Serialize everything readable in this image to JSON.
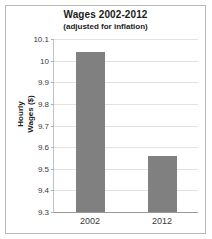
{
  "chart_data": {
    "type": "bar",
    "title": "Wages 2002-2012",
    "subtitle": "(adjusted for inflation)",
    "xlabel": "",
    "ylabel": "Hourly Wages ($)",
    "ylabel_line1": "Hourly",
    "ylabel_line2": "Wages ($)",
    "categories": [
      "2002",
      "2012"
    ],
    "values": [
      10.04,
      9.56
    ],
    "ylim": [
      9.3,
      10.1
    ],
    "yticks": [
      9.3,
      9.4,
      9.5,
      9.6,
      9.7,
      9.8,
      9.9,
      10.0,
      10.1
    ],
    "ytick_labels": [
      "9.3",
      "9.4",
      "9.5",
      "9.6",
      "9.7",
      "9.8",
      "9.9",
      "10",
      "10.1"
    ],
    "grid": true,
    "legend": false,
    "bar_color": "#808080",
    "gridline_color": "#e2e2e2",
    "background_color": "#ffffff",
    "border_color": "#b9b9b9"
  }
}
